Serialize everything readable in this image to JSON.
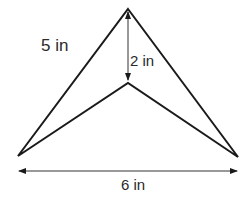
{
  "diagram": {
    "type": "concave-kite (arrowhead) with dimensions",
    "labels": {
      "side": "5 in",
      "height": "2 in",
      "base": "6 in"
    },
    "stroke_color": "#1a1a1a",
    "vertices": {
      "apex": [
        128,
        9
      ],
      "inner": [
        128,
        83
      ],
      "left": [
        18,
        156
      ],
      "right": [
        238,
        157
      ]
    }
  }
}
